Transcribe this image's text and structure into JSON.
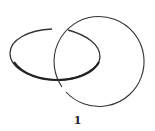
{
  "diagram": {
    "type": "link-diagram",
    "label": "1",
    "stroke_color": "#333333",
    "components": [
      {
        "name": "ellipse-loop"
      },
      {
        "name": "circle-loop"
      }
    ],
    "crossings": 2
  }
}
